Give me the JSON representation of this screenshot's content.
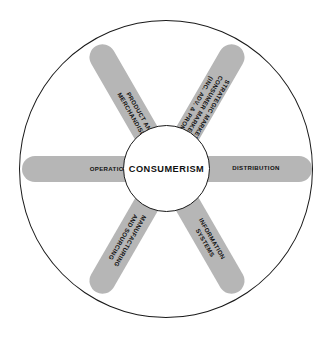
{
  "diagram": {
    "type": "hub-and-spoke-wheel",
    "hub": {
      "label": "CONSUMERISM"
    },
    "colors": {
      "spoke_fill": "#b6b6b6",
      "outline": "#1a1a1a",
      "background": "#ffffff",
      "text": "#111111"
    },
    "spokes": [
      {
        "id": "product-and-merchandising",
        "direction": "north-west",
        "lines": [
          "PRODUCT AND",
          "MERCHANDISING"
        ],
        "text": "PRODUCT AND MERCHANDISING"
      },
      {
        "id": "strategic-marketing",
        "direction": "north-east",
        "lines": [
          "STRATEGIC MARKETING",
          "CONSUMER MARKETING",
          "(INC. ADV. & PROMO)"
        ],
        "text": "STRATEGIC MARKETING CONSUMER MARKETING (INC. ADV. & PROMO)"
      },
      {
        "id": "operations",
        "direction": "west",
        "lines": [
          "OPERATIONS"
        ],
        "text": "OPERATIONS"
      },
      {
        "id": "distribution",
        "direction": "east",
        "lines": [
          "DISTRIBUTION"
        ],
        "text": "DISTRIBUTION"
      },
      {
        "id": "manufacturing-and-sourcing",
        "direction": "south-west",
        "lines": [
          "MANUFACTURING",
          "AND SOURCING"
        ],
        "text": "MANUFACTURING AND SOURCING"
      },
      {
        "id": "information-systems",
        "direction": "south-east",
        "lines": [
          "INFORMATION",
          "SYSTEMS"
        ],
        "text": "INFORMATION SYSTEMS"
      }
    ]
  }
}
